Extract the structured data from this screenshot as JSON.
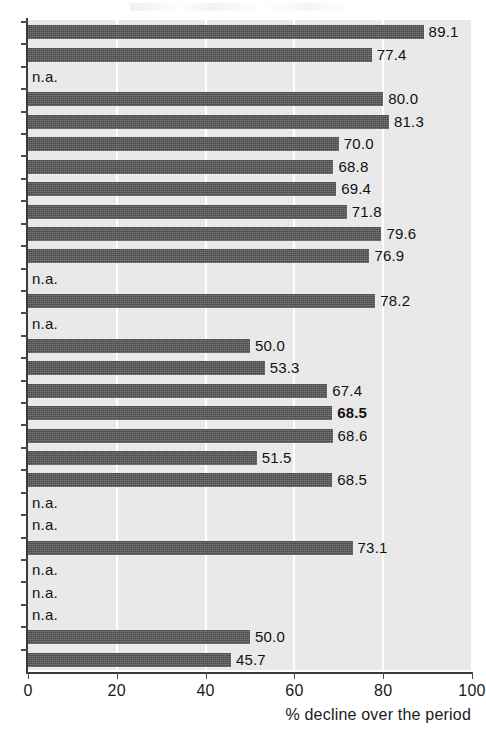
{
  "chart_data": {
    "type": "bar",
    "orientation": "horizontal",
    "title": "",
    "subtitle": "",
    "xlabel": "% decline over the period",
    "ylabel": "",
    "xlim": [
      0,
      100
    ],
    "xticks": [
      0,
      20,
      40,
      60,
      80,
      100
    ],
    "xtick_labels": [
      "0",
      "20",
      "40",
      "60",
      "80",
      "100"
    ],
    "grid": "vertical-white-gridlines-at-xticks",
    "legend": "none",
    "missing_label": "n.a.",
    "bar_color": "#5a5a5a",
    "plot_background": "#e9e9e9",
    "page_background": "#ffffff",
    "axis_color": "#3a3a3a",
    "n_rows": 29,
    "categories": [
      "row-1",
      "row-2",
      "row-3",
      "row-4",
      "row-5",
      "row-6",
      "row-7",
      "row-8",
      "row-9",
      "row-10",
      "row-11",
      "row-12",
      "row-13",
      "row-14",
      "row-15",
      "row-16",
      "row-17",
      "row-18",
      "row-19",
      "row-20",
      "row-21",
      "row-22",
      "row-23",
      "row-24",
      "row-25",
      "row-26",
      "row-27",
      "row-28",
      "row-29"
    ],
    "values": [
      89.1,
      77.4,
      null,
      80.0,
      81.3,
      70.0,
      68.8,
      69.4,
      71.8,
      79.6,
      76.9,
      null,
      78.2,
      null,
      50.0,
      53.3,
      67.4,
      68.5,
      68.6,
      51.5,
      68.5,
      null,
      null,
      73.1,
      null,
      null,
      null,
      50.0,
      45.7
    ],
    "value_labels": [
      "89.1",
      "77.4",
      "n.a.",
      "80.0",
      "81.3",
      "70.0",
      "68.8",
      "69.4",
      "71.8",
      "79.6",
      "76.9",
      "n.a.",
      "78.2",
      "n.a.",
      "50.0",
      "53.3",
      "67.4",
      "68.5",
      "68.6",
      "51.5",
      "68.5",
      "n.a.",
      "n.a.",
      "73.1",
      "n.a.",
      "n.a.",
      "n.a.",
      "50.0",
      "45.7"
    ],
    "emphasized_rows": [
      18
    ],
    "emphasis_style": "bold"
  }
}
